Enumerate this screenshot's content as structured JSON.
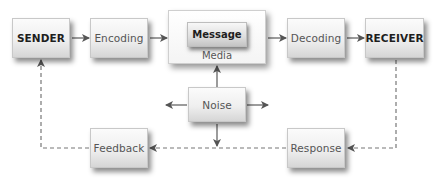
{
  "diagram": {
    "nodes": {
      "sender": "SENDER",
      "encoding": "Encoding",
      "message": "Message",
      "media": "Media",
      "decoding": "Decoding",
      "receiver": "RECEIVER",
      "noise": "Noise",
      "feedback": "Feedback",
      "response": "Response"
    },
    "edges": [
      {
        "from": "SENDER",
        "to": "Encoding",
        "style": "solid"
      },
      {
        "from": "Encoding",
        "to": "Media",
        "style": "solid"
      },
      {
        "from": "Media",
        "to": "Decoding",
        "style": "solid"
      },
      {
        "from": "Decoding",
        "to": "RECEIVER",
        "style": "solid"
      },
      {
        "from": "Noise",
        "to": "Media",
        "style": "solid"
      },
      {
        "from": "Noise",
        "to": "left",
        "style": "solid"
      },
      {
        "from": "Noise",
        "to": "right",
        "style": "solid"
      },
      {
        "from": "Noise",
        "to": "feedback-line",
        "style": "solid"
      },
      {
        "from": "RECEIVER",
        "to": "Response",
        "style": "dashed"
      },
      {
        "from": "Response",
        "to": "Feedback",
        "style": "dashed"
      },
      {
        "from": "Feedback",
        "to": "SENDER",
        "style": "dashed"
      }
    ],
    "colors": {
      "arrow": "#555555",
      "box_border": "#c8c8c8",
      "bold_text": "#1e1e1e",
      "text": "#555555"
    }
  }
}
